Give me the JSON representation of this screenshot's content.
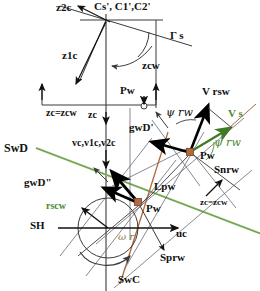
{
  "figure": {
    "type": "technical-vector-diagram",
    "width": 260,
    "height": 291,
    "background": "#ffffff",
    "colors": {
      "line": "#3a3a3a",
      "bold_vector": "#000000",
      "green": "#4f8a2f",
      "green_light": "#9fc47e",
      "brown": "#a9674a",
      "olive": "#8a7a3a",
      "marker": "#b06a3b"
    }
  },
  "labels": {
    "z2c": "z2c",
    "cs_c1_c2": "Cs', C1',C2'",
    "gamma_s": "Γ s",
    "z1c": "z1c",
    "zcw": "zcw",
    "pw_top": "Pw",
    "zc_eq_zcw_left": "zc=zcw",
    "zc": "zc",
    "vc_v1c_v2c": "vc,v1c,v2c",
    "swd": "SwD",
    "gwd_prime": "gwD'",
    "gwd_dprime": "gwD\"",
    "vrsw": "V rsw",
    "vs": "V s",
    "psi_rw_black": "ψ rw",
    "psi_rw_green": "ψ rw",
    "pw_right": "Pw",
    "snrw": "Snrw",
    "lpw": "Lpw",
    "zc_eq_zcw_right": "zc=zcw",
    "rscw": "rscw",
    "sh": "SH",
    "pw_center": "Pw",
    "omega_r": "ω r",
    "uc": "uc",
    "sprw": "Sprw",
    "swc": "SwC"
  }
}
